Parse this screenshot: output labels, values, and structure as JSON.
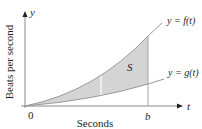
{
  "diagram": {
    "y_axis_label": "y",
    "x_axis_label": "t",
    "vertical_axis_title": "Beats per second",
    "horizontal_axis_title": "Seconds",
    "origin_label": "0",
    "b_label": "b",
    "region_label": "S",
    "curve_f_label": "y = f(t)",
    "curve_g_label": "y = g(t)",
    "colors": {
      "axis": "#8a8a8a",
      "curve": "#9a9a9a",
      "shade": "#d4d4d4",
      "text": "#231f20"
    }
  }
}
